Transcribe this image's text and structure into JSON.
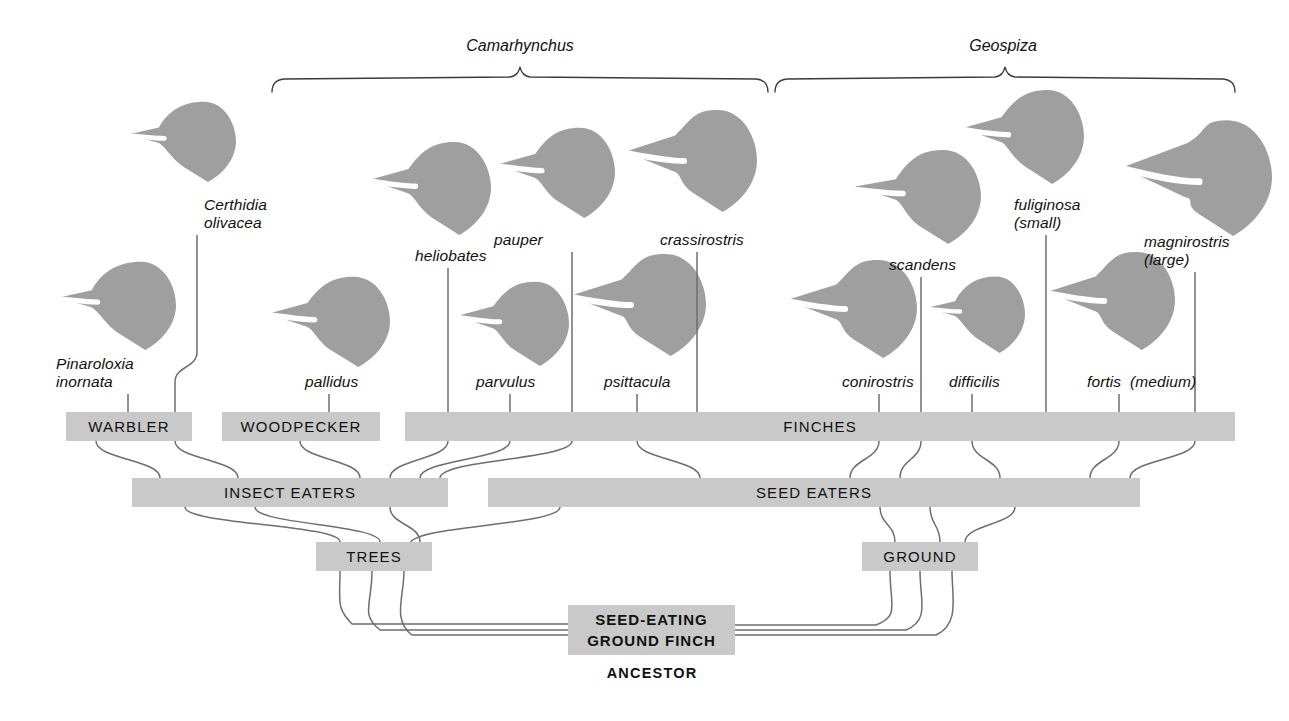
{
  "palette": {
    "fill": "#9f9f9f",
    "box": "#c9c9c9",
    "line": "#6e6e6e",
    "text": "#111111",
    "white": "#ffffff"
  },
  "genera": [
    {
      "name": "Camarhynchus",
      "label_x": 520,
      "label_y": 48,
      "bracket_x1": 272,
      "bracket_x2": 768,
      "bracket_y": 78
    },
    {
      "name": "Geospiza",
      "label_x": 1003,
      "label_y": 48,
      "bracket_x1": 775,
      "bracket_x2": 1235,
      "bracket_y": 78
    }
  ],
  "species": [
    {
      "name": "Certhidia\nolivacea",
      "label_x": 204,
      "label_y": 196,
      "tick_x": 197,
      "bird_x": 128,
      "bird_y": 100,
      "bird_w": 108,
      "bird_h": 82,
      "beak": "thin"
    },
    {
      "name": "Pinaroloxia\ninornata",
      "label_x": 56,
      "label_y": 355,
      "tick_x": 128,
      "bird_x": 58,
      "bird_y": 260,
      "bird_w": 118,
      "bird_h": 90,
      "beak": "thin"
    },
    {
      "name": "pallidus",
      "label_x": 305,
      "label_y": 373,
      "tick_x": 329,
      "bird_x": 268,
      "bird_y": 275,
      "bird_w": 122,
      "bird_h": 92,
      "beak": "medium"
    },
    {
      "name": "heliobates",
      "label_x": 415,
      "label_y": 247,
      "tick_x": 448,
      "bird_x": 369,
      "bird_y": 140,
      "bird_w": 122,
      "bird_h": 95,
      "beak": "medium"
    },
    {
      "name": "parvulus",
      "label_x": 476,
      "label_y": 373,
      "tick_x": 510,
      "bird_x": 457,
      "bird_y": 280,
      "bird_w": 112,
      "bird_h": 86,
      "beak": "medium"
    },
    {
      "name": "pauper",
      "label_x": 494,
      "label_y": 231,
      "tick_x": 572,
      "bird_x": 497,
      "bird_y": 126,
      "bird_w": 118,
      "bird_h": 92,
      "beak": "medium"
    },
    {
      "name": "psittacula",
      "label_x": 604,
      "label_y": 373,
      "tick_x": 637,
      "bird_x": 570,
      "bird_y": 252,
      "bird_w": 136,
      "bird_h": 104,
      "beak": "thick"
    },
    {
      "name": "crassirostris",
      "label_x": 660,
      "label_y": 231,
      "tick_x": 697,
      "bird_x": 625,
      "bird_y": 108,
      "bird_w": 132,
      "bird_h": 104,
      "beak": "thick"
    },
    {
      "name": "conirostris",
      "label_x": 842,
      "label_y": 373,
      "tick_x": 879,
      "bird_x": 787,
      "bird_y": 258,
      "bird_w": 130,
      "bird_h": 100,
      "beak": "thick"
    },
    {
      "name": "scandens",
      "label_x": 889,
      "label_y": 256,
      "tick_x": 921,
      "bird_x": 855,
      "bird_y": 148,
      "bird_w": 126,
      "bird_h": 96,
      "beak": "long"
    },
    {
      "name": "difficilis",
      "label_x": 949,
      "label_y": 373,
      "tick_x": 972,
      "bird_x": 927,
      "bird_y": 275,
      "bird_w": 98,
      "bird_h": 78,
      "beak": "thin"
    },
    {
      "name": "fuliginosa\n(small)",
      "label_x": 1014,
      "label_y": 196,
      "tick_x": 1046,
      "bird_x": 962,
      "bird_y": 88,
      "bird_w": 122,
      "bird_h": 96,
      "beak": "medium"
    },
    {
      "name": "fortis  (medium)",
      "label_x": 1087,
      "label_y": 373,
      "tick_x": 1119,
      "bird_x": 1047,
      "bird_y": 250,
      "bird_w": 128,
      "bird_h": 100,
      "beak": "thick"
    },
    {
      "name": "magnirostris\n(large)",
      "label_x": 1144,
      "label_y": 233,
      "tick_x": 1195,
      "bird_x": 1122,
      "bird_y": 118,
      "bird_w": 150,
      "bird_h": 118,
      "beak": "huge"
    }
  ],
  "rows": {
    "habit": [
      {
        "id": "warbler",
        "label": "WARBLER",
        "x": 66,
        "y": 412,
        "w": 126,
        "h": 29
      },
      {
        "id": "woodpecker",
        "label": "WOODPECKER",
        "x": 222,
        "y": 412,
        "w": 158,
        "h": 29
      },
      {
        "id": "finches",
        "label": "FINCHES",
        "x": 405,
        "y": 412,
        "w": 830,
        "h": 29
      }
    ],
    "diet": [
      {
        "id": "insect-eaters",
        "label": "INSECT EATERS",
        "x": 132,
        "y": 478,
        "w": 316,
        "h": 29
      },
      {
        "id": "seed-eaters",
        "label": "SEED EATERS",
        "x": 488,
        "y": 478,
        "w": 652,
        "h": 29
      }
    ],
    "habitat": [
      {
        "id": "trees",
        "label": "TREES",
        "x": 316,
        "y": 542,
        "w": 116,
        "h": 29
      },
      {
        "id": "ground",
        "label": "GROUND",
        "x": 862,
        "y": 542,
        "w": 116,
        "h": 29
      }
    ],
    "ancestor": {
      "id": "seed-eating-ground-finch",
      "line1": "SEED-EATING",
      "line2": "GROUND  FINCH",
      "caption": "ANCESTOR",
      "x": 568,
      "y": 605,
      "w": 167,
      "h": 50,
      "caption_x": 652,
      "caption_y": 665
    }
  }
}
